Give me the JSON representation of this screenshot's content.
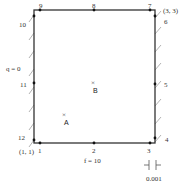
{
  "diagram": {
    "corners": {
      "bottom_left_coord": "(1, 1)",
      "top_right_coord": "(3, 3)"
    },
    "boundary_conditions": {
      "left": "q = 0",
      "bottom": "f = 10"
    },
    "nodes": [
      {
        "id": "1",
        "label": "1"
      },
      {
        "id": "2",
        "label": "2"
      },
      {
        "id": "3",
        "label": "3"
      },
      {
        "id": "4",
        "label": "4"
      },
      {
        "id": "5",
        "label": "5"
      },
      {
        "id": "6",
        "label": "6"
      },
      {
        "id": "7",
        "label": "7"
      },
      {
        "id": "8",
        "label": "8"
      },
      {
        "id": "9",
        "label": "9"
      },
      {
        "id": "10",
        "label": "10"
      },
      {
        "id": "11",
        "label": "11"
      },
      {
        "id": "12",
        "label": "12"
      }
    ],
    "interior_points": [
      {
        "label": "A",
        "marker": "×"
      },
      {
        "label": "B",
        "marker": "×"
      }
    ],
    "scale": {
      "label": "0.001"
    },
    "colors": {
      "line": "#333333",
      "hatch": "#9a9a9a",
      "text": "#333333"
    }
  }
}
